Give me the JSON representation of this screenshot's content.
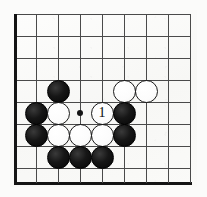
{
  "figure": {
    "board_size_label": "9x9 visible section",
    "colors": {
      "board_background": "#fafaf8",
      "grid_line": "#4a4a4a",
      "edge_line": "#141414",
      "black_stone": "#111111",
      "white_stone": "#ffffff"
    }
  },
  "board": {
    "columns": 9,
    "rows": 9,
    "line_spacing_px": 22,
    "origin_x_px": 14,
    "origin_y_px": 14,
    "edges": {
      "left": "thick",
      "bottom": "thick",
      "top": "thin",
      "right": "thin"
    },
    "vertical_line_x": [
      14,
      36,
      58,
      80,
      102,
      124,
      146,
      168,
      190
    ],
    "horizontal_line_y": [
      14,
      36,
      58,
      80,
      102,
      124,
      146,
      168,
      182
    ],
    "star_points": [
      {
        "name": "hoshi",
        "x": 80,
        "y": 113
      }
    ]
  },
  "stones": [
    {
      "color": "black",
      "x": 58,
      "y": 91,
      "label": ""
    },
    {
      "color": "white",
      "x": 124,
      "y": 91,
      "label": ""
    },
    {
      "color": "white",
      "x": 146,
      "y": 91,
      "label": ""
    },
    {
      "color": "black",
      "x": 36,
      "y": 113,
      "label": ""
    },
    {
      "color": "white",
      "x": 58,
      "y": 113,
      "label": ""
    },
    {
      "color": "white",
      "x": 102,
      "y": 113,
      "label": "1"
    },
    {
      "color": "black",
      "x": 124,
      "y": 113,
      "label": ""
    },
    {
      "color": "black",
      "x": 36,
      "y": 135,
      "label": ""
    },
    {
      "color": "white",
      "x": 58,
      "y": 135,
      "label": ""
    },
    {
      "color": "white",
      "x": 80,
      "y": 135,
      "label": ""
    },
    {
      "color": "white",
      "x": 102,
      "y": 135,
      "label": ""
    },
    {
      "color": "black",
      "x": 124,
      "y": 135,
      "label": ""
    },
    {
      "color": "black",
      "x": 58,
      "y": 157,
      "label": ""
    },
    {
      "color": "black",
      "x": 80,
      "y": 157,
      "label": ""
    },
    {
      "color": "black",
      "x": 102,
      "y": 157,
      "label": ""
    }
  ],
  "move_markers": [
    {
      "number": "1",
      "color": "white",
      "x": 102,
      "y": 113
    }
  ]
}
